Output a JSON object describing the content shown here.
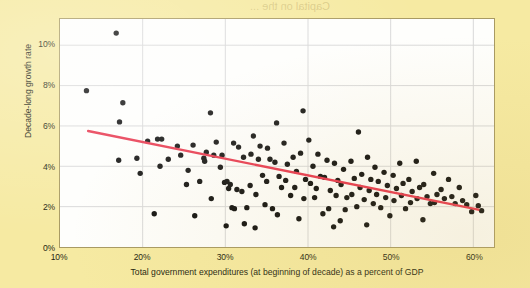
{
  "figure": {
    "background_color": "#f6eaa2",
    "plot_background_color": "#fefefc",
    "frame_color": "#a89a63",
    "grid_color": "#d9d9d9",
    "point_color": "#111111",
    "trendline_color": "#e8384f"
  },
  "bleed_through": {
    "top_text": "Capital on the ... ",
    "visible": true
  },
  "chart_data": {
    "type": "scatter",
    "title": "",
    "xlabel": "Total government expenditures (at beginning of decade) as a percent of GDP",
    "ylabel": "Decade-long growth rate",
    "xlim": [
      10,
      62.5
    ],
    "ylim": [
      0,
      11.3
    ],
    "xticks": [
      10,
      20,
      30,
      40,
      50,
      60
    ],
    "xtick_labels": [
      "10%",
      "20%",
      "30%",
      "40%",
      "50%",
      "60%"
    ],
    "yticks": [
      0,
      2,
      4,
      6,
      8,
      10
    ],
    "ytick_labels": [
      "0%",
      "2%",
      "4%",
      "6%",
      "8%",
      "10%"
    ],
    "grid": true,
    "legend": "none",
    "marker": "filled-circle",
    "marker_size_px": 5.4,
    "trendline": {
      "type": "linear-fit",
      "color": "#e8384f",
      "width_px": 2.4,
      "x_start": 13.4,
      "y_start": 5.75,
      "x_end": 60.6,
      "y_end": 1.85
    },
    "series": [
      {
        "name": "Countries by decade",
        "points": [
          [
            13.2,
            7.75
          ],
          [
            16.8,
            10.6
          ],
          [
            17.6,
            7.15
          ],
          [
            17.2,
            6.2
          ],
          [
            17.1,
            4.3
          ],
          [
            19.7,
            3.65
          ],
          [
            20.6,
            5.25
          ],
          [
            21.8,
            5.35
          ],
          [
            22.3,
            5.35
          ],
          [
            22.1,
            4.0
          ],
          [
            21.4,
            1.65
          ],
          [
            24.2,
            5.0
          ],
          [
            24.6,
            4.55
          ],
          [
            25.5,
            3.8
          ],
          [
            25.3,
            3.1
          ],
          [
            26.9,
            3.25
          ],
          [
            26.1,
            5.05
          ],
          [
            27.7,
            4.7
          ],
          [
            27.4,
            4.4
          ],
          [
            27.5,
            4.25
          ],
          [
            28.2,
            6.65
          ],
          [
            28.6,
            4.55
          ],
          [
            28.3,
            2.4
          ],
          [
            28.9,
            5.2
          ],
          [
            29.6,
            4.55
          ],
          [
            29.4,
            3.95
          ],
          [
            29.9,
            3.2
          ],
          [
            30.2,
            3.25
          ],
          [
            30.6,
            3.1
          ],
          [
            30.4,
            2.9
          ],
          [
            30.8,
            1.95
          ],
          [
            31.1,
            1.9
          ],
          [
            31.4,
            2.85
          ],
          [
            31.0,
            5.15
          ],
          [
            31.6,
            4.95
          ],
          [
            32.2,
            4.45
          ],
          [
            32.0,
            2.75
          ],
          [
            32.6,
            1.95
          ],
          [
            32.3,
            1.15
          ],
          [
            33.1,
            4.6
          ],
          [
            33.4,
            5.5
          ],
          [
            33.0,
            3.05
          ],
          [
            33.7,
            2.6
          ],
          [
            34.2,
            5.0
          ],
          [
            34.0,
            4.35
          ],
          [
            34.5,
            3.55
          ],
          [
            34.8,
            2.1
          ],
          [
            35.1,
            4.9
          ],
          [
            35.4,
            4.35
          ],
          [
            35.0,
            3.25
          ],
          [
            35.7,
            1.9
          ],
          [
            36.2,
            6.15
          ],
          [
            36.0,
            4.2
          ],
          [
            36.5,
            3.5
          ],
          [
            36.8,
            2.95
          ],
          [
            36.3,
            1.6
          ],
          [
            37.1,
            5.15
          ],
          [
            37.5,
            4.1
          ],
          [
            37.3,
            3.3
          ],
          [
            37.9,
            2.55
          ],
          [
            38.2,
            4.45
          ],
          [
            38.6,
            3.75
          ],
          [
            38.4,
            2.95
          ],
          [
            38.9,
            1.4
          ],
          [
            39.4,
            6.75
          ],
          [
            39.1,
            4.65
          ],
          [
            39.7,
            3.35
          ],
          [
            39.5,
            2.4
          ],
          [
            40.1,
            5.3
          ],
          [
            40.6,
            4.0
          ],
          [
            40.3,
            3.15
          ],
          [
            40.8,
            2.45
          ],
          [
            41.2,
            4.6
          ],
          [
            41.5,
            3.5
          ],
          [
            41.0,
            2.9
          ],
          [
            41.8,
            1.65
          ],
          [
            42.3,
            4.3
          ],
          [
            42.0,
            3.45
          ],
          [
            42.7,
            2.8
          ],
          [
            42.5,
            1.9
          ],
          [
            43.2,
            4.15
          ],
          [
            43.6,
            3.3
          ],
          [
            43.4,
            2.55
          ],
          [
            43.9,
            1.3
          ],
          [
            44.3,
            3.85
          ],
          [
            44.0,
            3.1
          ],
          [
            44.7,
            2.45
          ],
          [
            44.5,
            1.85
          ],
          [
            45.2,
            4.25
          ],
          [
            45.6,
            3.4
          ],
          [
            45.3,
            2.6
          ],
          [
            45.9,
            2.0
          ],
          [
            46.1,
            5.7
          ],
          [
            46.5,
            3.6
          ],
          [
            46.3,
            2.95
          ],
          [
            46.8,
            2.35
          ],
          [
            47.2,
            4.45
          ],
          [
            47.6,
            3.35
          ],
          [
            47.4,
            2.8
          ],
          [
            47.9,
            2.15
          ],
          [
            48.1,
            3.95
          ],
          [
            48.5,
            3.25
          ],
          [
            48.3,
            2.6
          ],
          [
            48.8,
            1.95
          ],
          [
            49.2,
            3.7
          ],
          [
            49.6,
            3.05
          ],
          [
            49.4,
            2.45
          ],
          [
            49.9,
            1.55
          ],
          [
            50.3,
            3.55
          ],
          [
            50.7,
            2.9
          ],
          [
            50.4,
            2.3
          ],
          [
            51.1,
            4.15
          ],
          [
            51.5,
            3.15
          ],
          [
            51.3,
            2.55
          ],
          [
            51.8,
            1.9
          ],
          [
            52.2,
            3.35
          ],
          [
            52.6,
            2.75
          ],
          [
            52.4,
            2.2
          ],
          [
            53.1,
            4.25
          ],
          [
            53.5,
            2.95
          ],
          [
            53.2,
            2.4
          ],
          [
            54.0,
            3.1
          ],
          [
            54.4,
            2.5
          ],
          [
            54.8,
            2.15
          ],
          [
            55.2,
            3.65
          ],
          [
            55.6,
            2.6
          ],
          [
            55.3,
            2.2
          ],
          [
            56.1,
            2.85
          ],
          [
            56.5,
            2.4
          ],
          [
            57.0,
            3.35
          ],
          [
            57.4,
            2.5
          ],
          [
            57.8,
            2.15
          ],
          [
            58.3,
            2.95
          ],
          [
            58.7,
            2.3
          ],
          [
            59.2,
            2.1
          ],
          [
            59.8,
            1.75
          ],
          [
            60.3,
            2.55
          ],
          [
            60.6,
            2.05
          ],
          [
            61.0,
            1.8
          ],
          [
            30.1,
            1.05
          ],
          [
            33.6,
            0.95
          ],
          [
            43.1,
            1.0
          ],
          [
            47.1,
            1.1
          ],
          [
            26.3,
            1.55
          ],
          [
            23.1,
            4.35
          ],
          [
            19.3,
            4.4
          ],
          [
            53.9,
            1.35
          ]
        ]
      }
    ]
  }
}
